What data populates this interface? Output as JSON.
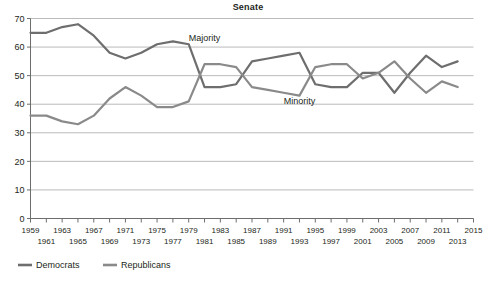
{
  "chart_data": {
    "type": "line",
    "title": "Senate",
    "xlabel": "",
    "ylabel": "",
    "ylim": [
      0,
      70
    ],
    "ytick_step": 10,
    "yticks": [
      0,
      10,
      20,
      30,
      40,
      50,
      60,
      70
    ],
    "grid": true,
    "grid_axis": "y",
    "legend_position": "bottom-left",
    "x": [
      1959,
      1961,
      1963,
      1965,
      1967,
      1969,
      1971,
      1973,
      1975,
      1977,
      1979,
      1981,
      1983,
      1985,
      1987,
      1989,
      1991,
      1993,
      1995,
      1997,
      1999,
      2001,
      2003,
      2005,
      2007,
      2009,
      2011,
      2013
    ],
    "xtick_labels_top": [
      "1959",
      "1963",
      "1967",
      "1971",
      "1975",
      "1979",
      "1983",
      "1987",
      "1991",
      "1995",
      "1999",
      "2003",
      "2007",
      "2011",
      "2015"
    ],
    "xtick_labels_bottom": [
      "1961",
      "1965",
      "1969",
      "1973",
      "1977",
      "1981",
      "1985",
      "1989",
      "1993",
      "1997",
      "2001",
      "2005",
      "2009",
      "2013"
    ],
    "xlim": [
      1959,
      2015
    ],
    "series": [
      {
        "name": "Democrats",
        "color": "#6e6e6e",
        "values": [
          65,
          65,
          67,
          68,
          64,
          58,
          56,
          58,
          61,
          62,
          61,
          46,
          46,
          47,
          55,
          56,
          57,
          58,
          47,
          46,
          46,
          51,
          51,
          44,
          51,
          57,
          53,
          55
        ]
      },
      {
        "name": "Republicans",
        "color": "#8a8a8a",
        "values": [
          36,
          36,
          34,
          33,
          36,
          42,
          46,
          43,
          39,
          39,
          41,
          54,
          54,
          53,
          46,
          45,
          44,
          43,
          53,
          54,
          54,
          49,
          51,
          55,
          49,
          44,
          48,
          46
        ]
      }
    ],
    "annotations": [
      {
        "text": "Majority",
        "x": 1981,
        "y": 62
      },
      {
        "text": "Minority",
        "x": 1993,
        "y": 40
      }
    ]
  },
  "legend": {
    "items": [
      {
        "label": "Democrats",
        "color": "#6e6e6e"
      },
      {
        "label": "Republicans",
        "color": "#8a8a8a"
      }
    ]
  },
  "colors": {
    "democrats": "#6e6e6e",
    "republicans": "#8a8a8a",
    "grid": "#a8a8a8",
    "axis": "#6d6d6d",
    "text": "#231f20"
  }
}
